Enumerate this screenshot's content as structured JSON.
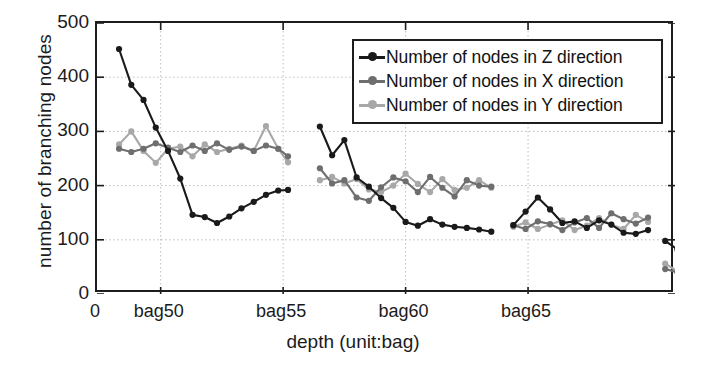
{
  "chart_data": {
    "type": "line",
    "title": "",
    "xlabel": "depth (unit:bag)",
    "ylabel": "number of branching nodes",
    "xlim": [
      47.4,
      71.0
    ],
    "ylim": [
      0,
      500
    ],
    "yticks": [
      0,
      100,
      200,
      300,
      400,
      500
    ],
    "xticks": [
      50,
      55,
      60,
      65
    ],
    "xticklabels": [
      "bag50",
      "bag55",
      "bag60",
      "bag65"
    ],
    "origin_label": "0",
    "grid": true,
    "legend_position": "upper right",
    "colors": {
      "z": "#1a1a1a",
      "x": "#6e6e6e",
      "y": "#a8a8a8",
      "axis": "#1d1d1d",
      "grid": "#bdbdbd",
      "background": "#ffffff"
    },
    "series": [
      {
        "name": "Number of nodes in Z direction",
        "color": "#1a1a1a",
        "segments": [
          {
            "x": [
              48.3,
              48.8,
              49.3,
              49.8,
              50.3,
              50.8,
              51.3,
              51.8,
              52.3,
              52.8,
              53.3,
              53.8,
              54.3,
              54.8,
              55.2
            ],
            "y": [
              452,
              386,
              358,
              307,
              264,
              213,
              146,
              142,
              131,
              143,
              158,
              170,
              183,
              191,
              192
            ]
          },
          {
            "x": [
              56.5,
              57.0,
              57.5,
              58.0,
              58.5,
              59.0,
              59.5,
              60.0,
              60.5,
              61.0,
              61.5,
              62.0,
              62.5,
              63.0,
              63.5
            ],
            "y": [
              309,
              256,
              284,
              215,
              198,
              177,
              159,
              133,
              126,
              138,
              128,
              124,
              122,
              119,
              115
            ]
          },
          {
            "x": [
              64.4,
              64.9,
              65.4,
              65.9,
              66.4,
              66.9,
              67.4,
              67.9,
              68.4,
              68.9,
              69.4,
              69.9
            ],
            "y": [
              127,
              152,
              178,
              156,
              131,
              134,
              122,
              136,
              128,
              113,
              111,
              118
            ]
          },
          {
            "x": [
              70.6,
              71.1,
              71.6,
              72.1,
              72.6,
              73.1,
              73.6,
              74.1,
              74.6,
              75.1,
              75.6,
              76.1
            ],
            "y": [
              98,
              82,
              98,
              63,
              71,
              77,
              56,
              39,
              12,
              12,
              12,
              11
            ]
          }
        ]
      },
      {
        "name": "Number of nodes in X direction",
        "color": "#6e6e6e",
        "segments": [
          {
            "x": [
              48.3,
              48.8,
              49.3,
              49.8,
              50.3,
              50.8,
              51.3,
              51.8,
              52.3,
              52.8,
              53.3,
              53.8,
              54.3,
              54.8,
              55.2
            ],
            "y": [
              268,
              262,
              268,
              278,
              270,
              262,
              274,
              264,
              278,
              266,
              272,
              264,
              274,
              268,
              254
            ]
          },
          {
            "x": [
              56.5,
              57.0,
              57.5,
              58.0,
              58.5,
              59.0,
              59.5,
              60.0,
              60.5,
              61.0,
              61.5,
              62.0,
              62.5,
              63.0,
              63.5
            ],
            "y": [
              232,
              204,
              210,
              178,
              172,
              197,
              215,
              208,
              188,
              216,
              196,
              180,
              210,
              200,
              198
            ]
          },
          {
            "x": [
              64.4,
              64.9,
              65.4,
              65.9,
              66.4,
              66.9,
              67.4,
              67.9,
              68.4,
              68.9,
              69.4,
              69.9
            ],
            "y": [
              127,
              120,
              134,
              129,
              118,
              132,
              140,
              122,
              149,
              138,
              130,
              141
            ]
          },
          {
            "x": [
              70.6,
              71.1,
              71.6,
              72.1,
              72.6,
              73.1,
              73.6,
              74.1,
              74.6,
              75.1,
              75.6,
              76.1
            ],
            "y": [
              46,
              40,
              46,
              42,
              50,
              48,
              44,
              50,
              43,
              48,
              44,
              47
            ]
          }
        ]
      },
      {
        "name": "Number of nodes in Y direction",
        "color": "#a8a8a8",
        "segments": [
          {
            "x": [
              48.3,
              48.8,
              49.3,
              49.8,
              50.3,
              50.8,
              51.3,
              51.8,
              52.3,
              52.8,
              53.3,
              53.8,
              54.3,
              54.8,
              55.2
            ],
            "y": [
              276,
              300,
              264,
              242,
              268,
              272,
              254,
              276,
              262,
              268,
              274,
              264,
              310,
              268,
              243
            ]
          },
          {
            "x": [
              56.5,
              57.0,
              57.5,
              58.0,
              58.5,
              59.0,
              59.5,
              60.0,
              60.5,
              61.0,
              61.5,
              62.0,
              62.5,
              63.0,
              63.5
            ],
            "y": [
              210,
              216,
              204,
              212,
              193,
              188,
              200,
              222,
              203,
              188,
              212,
              192,
              196,
              210,
              196
            ]
          },
          {
            "x": [
              64.4,
              64.9,
              65.4,
              65.9,
              66.4,
              66.9,
              67.4,
              67.9,
              68.4,
              68.9,
              69.4,
              69.9
            ],
            "y": [
              124,
              132,
              120,
              128,
              136,
              118,
              126,
              140,
              128,
              120,
              146,
              133
            ]
          },
          {
            "x": [
              70.6,
              71.1,
              71.6,
              72.1,
              72.6,
              73.1,
              73.6,
              74.1,
              74.6,
              75.1,
              75.6,
              76.1
            ],
            "y": [
              56,
              42,
              50,
              40,
              46,
              52,
              46,
              44,
              50,
              42,
              48,
              44
            ]
          }
        ]
      }
    ]
  },
  "legend": {
    "items": [
      {
        "label": "Number of nodes in Z direction",
        "color": "#1a1a1a"
      },
      {
        "label": "Number of nodes in X direction",
        "color": "#6e6e6e"
      },
      {
        "label": "Number of nodes in Y direction",
        "color": "#a8a8a8"
      }
    ]
  }
}
